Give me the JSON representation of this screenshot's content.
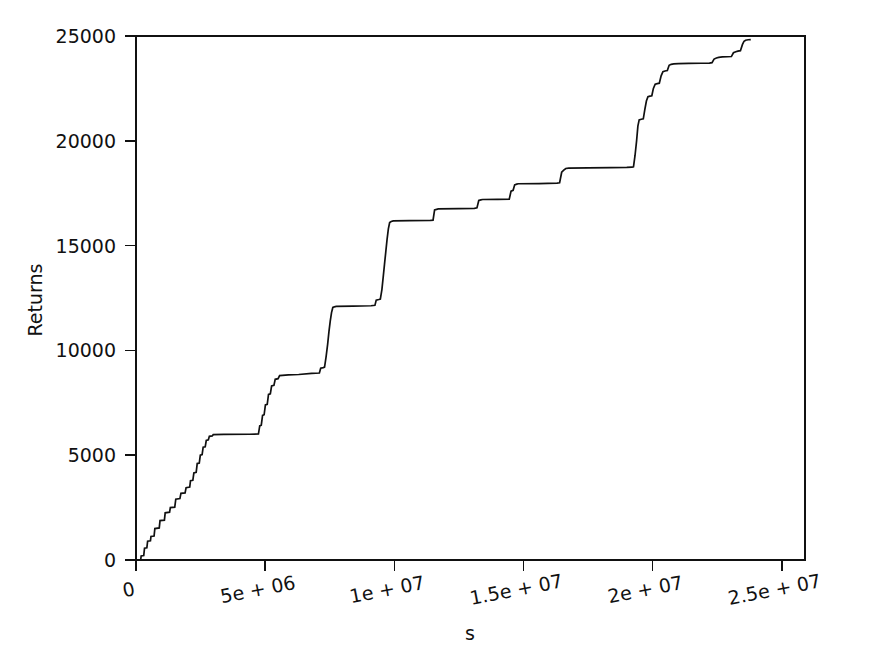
{
  "chart_data": {
    "type": "line",
    "title": "",
    "subtitle": "",
    "xlabel": "s",
    "ylabel": "Returns",
    "xlim": [
      0,
      25900000
    ],
    "ylim": [
      0,
      25000
    ],
    "grid": false,
    "legend": null,
    "annotations": [],
    "x_ticks": [
      {
        "value": 0,
        "label": "0"
      },
      {
        "value": 5000000,
        "label": "5e + 06"
      },
      {
        "value": 10000000,
        "label": "1e + 07"
      },
      {
        "value": 15000000,
        "label": "1.5e + 07"
      },
      {
        "value": 20000000,
        "label": "2e + 07"
      },
      {
        "value": 25000000,
        "label": "2.5e + 07"
      }
    ],
    "y_ticks": [
      {
        "value": 0,
        "label": "0"
      },
      {
        "value": 5000,
        "label": "5000"
      },
      {
        "value": 10000,
        "label": "10000"
      },
      {
        "value": 15000,
        "label": "15000"
      },
      {
        "value": 20000,
        "label": "20000"
      },
      {
        "value": 25000,
        "label": "25000"
      }
    ],
    "series": [
      {
        "name": "cumulative-returns",
        "color": "#101010",
        "points": [
          [
            0,
            0
          ],
          [
            180000,
            0
          ],
          [
            200000,
            190
          ],
          [
            300000,
            210
          ],
          [
            330000,
            560
          ],
          [
            420000,
            580
          ],
          [
            450000,
            900
          ],
          [
            560000,
            920
          ],
          [
            580000,
            1120
          ],
          [
            700000,
            1140
          ],
          [
            730000,
            1500
          ],
          [
            900000,
            1530
          ],
          [
            930000,
            1880
          ],
          [
            1100000,
            1900
          ],
          [
            1130000,
            2250
          ],
          [
            1300000,
            2280
          ],
          [
            1330000,
            2500
          ],
          [
            1500000,
            2520
          ],
          [
            1540000,
            2900
          ],
          [
            1700000,
            2930
          ],
          [
            1740000,
            3180
          ],
          [
            1900000,
            3200
          ],
          [
            1940000,
            3450
          ],
          [
            2080000,
            3480
          ],
          [
            2110000,
            3780
          ],
          [
            2200000,
            3800
          ],
          [
            2240000,
            4150
          ],
          [
            2330000,
            4180
          ],
          [
            2370000,
            4600
          ],
          [
            2450000,
            4620
          ],
          [
            2490000,
            5000
          ],
          [
            2560000,
            5030
          ],
          [
            2600000,
            5380
          ],
          [
            2680000,
            5400
          ],
          [
            2720000,
            5700
          ],
          [
            2800000,
            5730
          ],
          [
            2840000,
            5900
          ],
          [
            2950000,
            5920
          ],
          [
            2990000,
            5980
          ],
          [
            3400000,
            5990
          ],
          [
            4400000,
            6000
          ],
          [
            4740000,
            6010
          ],
          [
            4790000,
            6400
          ],
          [
            4850000,
            6430
          ],
          [
            4900000,
            6900
          ],
          [
            4960000,
            6930
          ],
          [
            5010000,
            7400
          ],
          [
            5080000,
            7430
          ],
          [
            5130000,
            7900
          ],
          [
            5200000,
            7930
          ],
          [
            5250000,
            8300
          ],
          [
            5340000,
            8330
          ],
          [
            5390000,
            8620
          ],
          [
            5500000,
            8650
          ],
          [
            5560000,
            8800
          ],
          [
            5900000,
            8830
          ],
          [
            6300000,
            8850
          ],
          [
            6800000,
            8900
          ],
          [
            7100000,
            8920
          ],
          [
            7150000,
            9150
          ],
          [
            7250000,
            9180
          ],
          [
            7300000,
            9200
          ],
          [
            7360000,
            9700
          ],
          [
            7420000,
            10300
          ],
          [
            7470000,
            10900
          ],
          [
            7520000,
            11400
          ],
          [
            7570000,
            11800
          ],
          [
            7620000,
            12050
          ],
          [
            7680000,
            12080
          ],
          [
            7750000,
            12100
          ],
          [
            8400000,
            12110
          ],
          [
            9100000,
            12130
          ],
          [
            9250000,
            12150
          ],
          [
            9300000,
            12400
          ],
          [
            9400000,
            12430
          ],
          [
            9460000,
            12450
          ],
          [
            9520000,
            12900
          ],
          [
            9570000,
            13500
          ],
          [
            9620000,
            14100
          ],
          [
            9670000,
            14700
          ],
          [
            9720000,
            15300
          ],
          [
            9770000,
            15800
          ],
          [
            9820000,
            16100
          ],
          [
            9880000,
            16150
          ],
          [
            9960000,
            16180
          ],
          [
            10600000,
            16190
          ],
          [
            11400000,
            16200
          ],
          [
            11500000,
            16210
          ],
          [
            11560000,
            16700
          ],
          [
            11640000,
            16730
          ],
          [
            11700000,
            16750
          ],
          [
            12500000,
            16760
          ],
          [
            13100000,
            16780
          ],
          [
            13200000,
            16800
          ],
          [
            13270000,
            17150
          ],
          [
            13350000,
            17180
          ],
          [
            13420000,
            17200
          ],
          [
            14000000,
            17210
          ],
          [
            14450000,
            17220
          ],
          [
            14520000,
            17600
          ],
          [
            14600000,
            17640
          ],
          [
            14660000,
            17900
          ],
          [
            14740000,
            17930
          ],
          [
            14800000,
            17950
          ],
          [
            15600000,
            17960
          ],
          [
            16300000,
            17980
          ],
          [
            16400000,
            18000
          ],
          [
            16480000,
            18500
          ],
          [
            16560000,
            18600
          ],
          [
            16640000,
            18680
          ],
          [
            16750000,
            18700
          ],
          [
            17500000,
            18710
          ],
          [
            18400000,
            18720
          ],
          [
            19000000,
            18730
          ],
          [
            19200000,
            18740
          ],
          [
            19260000,
            18760
          ],
          [
            19320000,
            19300
          ],
          [
            19380000,
            20000
          ],
          [
            19430000,
            20700
          ],
          [
            19480000,
            21000
          ],
          [
            19560000,
            21030
          ],
          [
            19640000,
            21050
          ],
          [
            19700000,
            21500
          ],
          [
            19760000,
            21900
          ],
          [
            19820000,
            22100
          ],
          [
            19900000,
            22130
          ],
          [
            19970000,
            22150
          ],
          [
            20030000,
            22500
          ],
          [
            20100000,
            22700
          ],
          [
            20180000,
            22730
          ],
          [
            20260000,
            22750
          ],
          [
            20330000,
            23100
          ],
          [
            20400000,
            23300
          ],
          [
            20480000,
            23330
          ],
          [
            20570000,
            23350
          ],
          [
            20640000,
            23600
          ],
          [
            20720000,
            23650
          ],
          [
            20820000,
            23670
          ],
          [
            21000000,
            23680
          ],
          [
            21400000,
            23690
          ],
          [
            21900000,
            23700
          ],
          [
            22200000,
            23710
          ],
          [
            22300000,
            23730
          ],
          [
            22380000,
            23900
          ],
          [
            22470000,
            23950
          ],
          [
            22560000,
            23980
          ],
          [
            22700000,
            24000
          ],
          [
            22900000,
            24010
          ],
          [
            23050000,
            24020
          ],
          [
            23130000,
            24200
          ],
          [
            23220000,
            24250
          ],
          [
            23300000,
            24280
          ],
          [
            23400000,
            24300
          ],
          [
            23480000,
            24600
          ],
          [
            23540000,
            24750
          ],
          [
            23600000,
            24800
          ],
          [
            23700000,
            24820
          ],
          [
            23800000,
            24830
          ]
        ]
      }
    ]
  },
  "axes": {
    "x_axis_name": "s",
    "y_axis_name": "Returns"
  }
}
